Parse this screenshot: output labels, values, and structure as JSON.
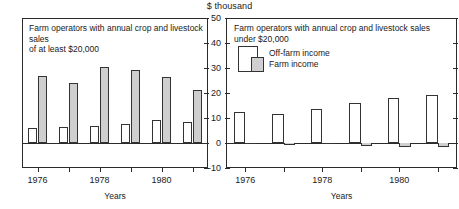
{
  "units_label": "$ thousand",
  "axis_title": "Years",
  "legend": {
    "off_farm": "Off-farm income",
    "farm": "Farm income"
  },
  "colors": {
    "off_farm": "#ffffff",
    "farm": "#cfcfcf",
    "outline": "#333333",
    "axis": "#2b2b2b",
    "text": "#1a1a1a"
  },
  "chart_data": [
    {
      "type": "bar",
      "id": "left",
      "title": "Farm operators with annual crop and livestock sales\nof at least $20,000",
      "xlabel": "Years",
      "ylabel": "$ thousand",
      "ylim": [
        -10,
        50
      ],
      "yticks": [
        -10,
        0,
        10,
        20,
        30,
        40,
        50
      ],
      "ytick_labels": [
        "-10",
        "0",
        "10",
        "20",
        "30",
        "40",
        "50"
      ],
      "grid": false,
      "legend_position": "none",
      "categories": [
        "1976",
        "1977",
        "1978",
        "1979",
        "1980",
        "1981"
      ],
      "xtick_labels": [
        "1976",
        "",
        "1978",
        "",
        "1980",
        ""
      ],
      "series": [
        {
          "name": "Off-farm income",
          "values": [
            6.1,
            6.4,
            7.0,
            7.8,
            9.3,
            8.5
          ]
        },
        {
          "name": "Farm income",
          "values": [
            26.7,
            23.9,
            30.5,
            29.3,
            26.4,
            21.2
          ]
        }
      ]
    },
    {
      "type": "bar",
      "id": "right",
      "title": "Farm operators with annual crop and livestock sales\nunder $20,000",
      "xlabel": "Years",
      "ylabel": "$ thousand",
      "ylim": [
        -10,
        50
      ],
      "yticks": [
        -10,
        0,
        10,
        20,
        30,
        40,
        50
      ],
      "ytick_labels": [
        "-10",
        "0",
        "10",
        "20",
        "30",
        "40",
        "50"
      ],
      "grid": false,
      "legend_position": "upper-left",
      "categories": [
        "1976",
        "1977",
        "1978",
        "1979",
        "1980",
        "1981"
      ],
      "xtick_labels": [
        "1976",
        "",
        "1978",
        "",
        "1980",
        ""
      ],
      "series": [
        {
          "name": "Off-farm income",
          "values": [
            12.3,
            11.7,
            13.6,
            16.1,
            18.0,
            19.3
          ]
        },
        {
          "name": "Farm income",
          "values": [
            -0.4,
            -0.9,
            -0.5,
            -1.2,
            -1.5,
            -1.4
          ]
        }
      ]
    }
  ]
}
